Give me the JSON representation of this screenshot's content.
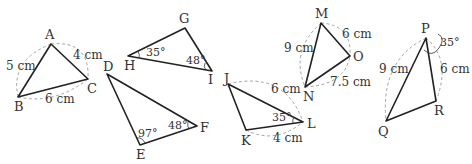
{
  "figures": [
    {
      "id": "ABC",
      "vertices": {
        "A": "A",
        "B": "B",
        "C": "C"
      },
      "measures": {
        "AB": "5 cm",
        "AC": "4 cm",
        "BC": "6 cm"
      }
    },
    {
      "id": "GHI",
      "vertices": {
        "G": "G",
        "H": "H",
        "I": "I"
      },
      "angles": {
        "H": "35°",
        "I": "48°"
      }
    },
    {
      "id": "DEF",
      "vertices": {
        "D": "D",
        "E": "E",
        "F": "F"
      },
      "angles": {
        "E": "97°",
        "F": "48°"
      }
    },
    {
      "id": "JKL",
      "vertices": {
        "J": "J",
        "K": "K",
        "L": "L"
      },
      "measures": {
        "JL": "6 cm",
        "KL": "4 cm"
      },
      "angles": {
        "L": "35°"
      }
    },
    {
      "id": "MNO",
      "vertices": {
        "M": "M",
        "N": "N",
        "O": "O"
      },
      "measures": {
        "MN": "9 cm",
        "MO": "6 cm",
        "NO": "7.5 cm"
      }
    },
    {
      "id": "PQR",
      "vertices": {
        "P": "P",
        "Q": "Q",
        "R": "R"
      },
      "measures": {
        "PQ": "9 cm",
        "PR": "6 cm"
      },
      "angles": {
        "P": "35°"
      }
    }
  ]
}
